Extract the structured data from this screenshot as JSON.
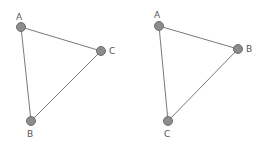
{
  "diagrams": [
    {
      "name": "left-triangle",
      "nodes": [
        {
          "label": "A",
          "x": 21,
          "y": 27,
          "lx": 16,
          "ly": 20
        },
        {
          "label": "C",
          "x": 101,
          "y": 51,
          "lx": 109,
          "ly": 54
        },
        {
          "label": "B",
          "x": 31,
          "y": 121,
          "lx": 27,
          "ly": 137
        }
      ],
      "edges": [
        [
          "A",
          "C"
        ],
        [
          "C",
          "B"
        ],
        [
          "B",
          "A"
        ]
      ]
    },
    {
      "name": "right-triangle",
      "nodes": [
        {
          "label": "A",
          "x": 159,
          "y": 26,
          "lx": 154,
          "ly": 18
        },
        {
          "label": "B",
          "x": 238,
          "y": 49,
          "lx": 246,
          "ly": 52
        },
        {
          "label": "C",
          "x": 168,
          "y": 121,
          "lx": 164,
          "ly": 137
        }
      ],
      "edges": [
        [
          "A",
          "B"
        ],
        [
          "B",
          "C"
        ],
        [
          "C",
          "A"
        ]
      ]
    }
  ],
  "colors": {
    "edge": "#7a7a7a",
    "node_fill": "#8c8c8c",
    "node_stroke": "#6e6e6e",
    "label": "#555555",
    "background": "#ffffff"
  }
}
